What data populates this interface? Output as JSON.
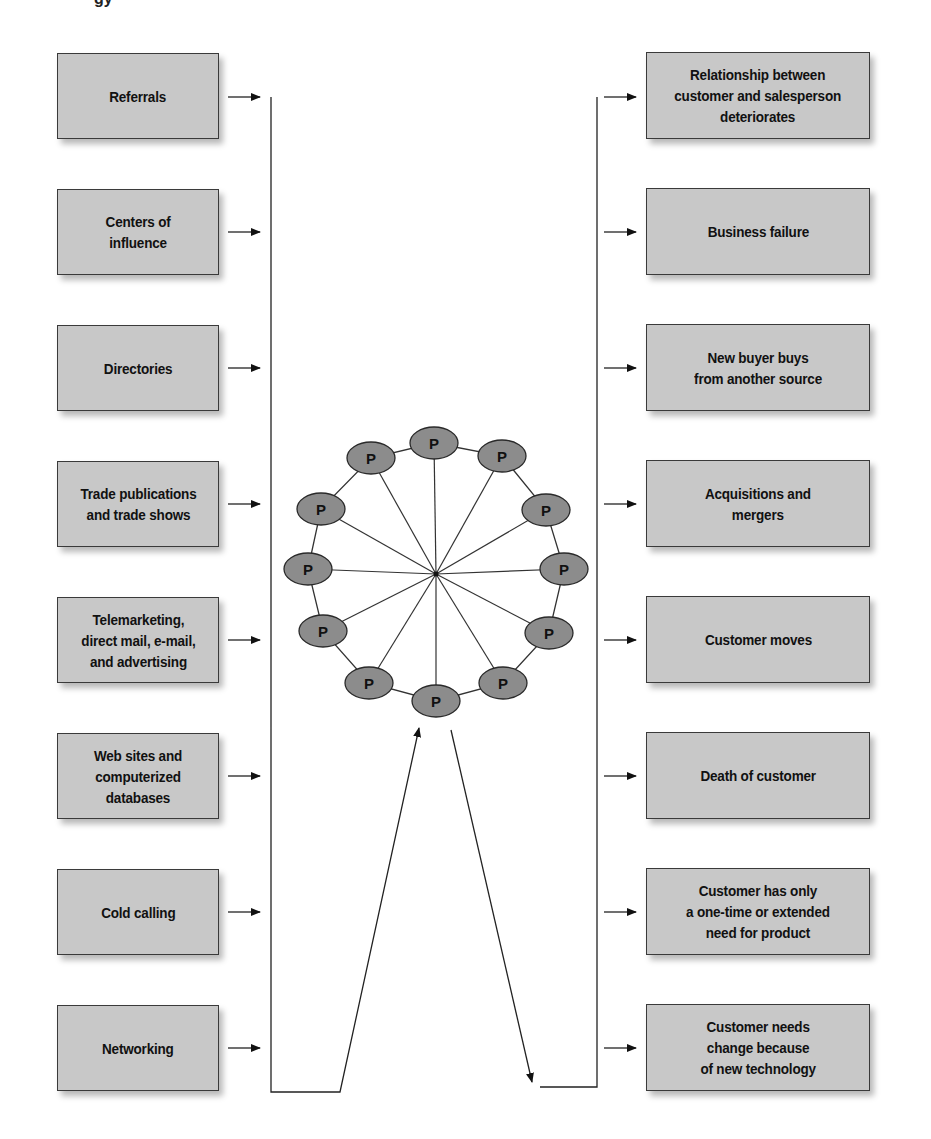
{
  "header_fragment": "gy",
  "sources": {
    "items": [
      {
        "label": "Referrals"
      },
      {
        "label": "Centers of\ninfluence"
      },
      {
        "label": "Directories"
      },
      {
        "label": "Trade publications\nand trade shows"
      },
      {
        "label": "Telemarketing,\ndirect mail, e-mail,\nand advertising"
      },
      {
        "label": "Web sites and\ncomputerized\ndatabases"
      },
      {
        "label": "Cold calling"
      },
      {
        "label": "Networking"
      }
    ]
  },
  "wheel": {
    "node_label": "P",
    "node_count": 12,
    "node_fill": "#8c8c8c",
    "center": [
      436,
      574
    ]
  },
  "losses": {
    "items": [
      {
        "label": "Relationship between\ncustomer and salesperson\ndeteriorates"
      },
      {
        "label": "Business failure"
      },
      {
        "label": "New buyer buys\nfrom another source"
      },
      {
        "label": "Acquisitions and\nmergers"
      },
      {
        "label": "Customer moves"
      },
      {
        "label": "Death of customer"
      },
      {
        "label": "Customer has only\na one-time or extended\nneed  for product"
      },
      {
        "label": "Customer needs\nchange because\nof new technology"
      }
    ]
  },
  "colors": {
    "box_fill": "#c8c8c8",
    "box_border": "#3a3a3a",
    "line": "#222222"
  }
}
